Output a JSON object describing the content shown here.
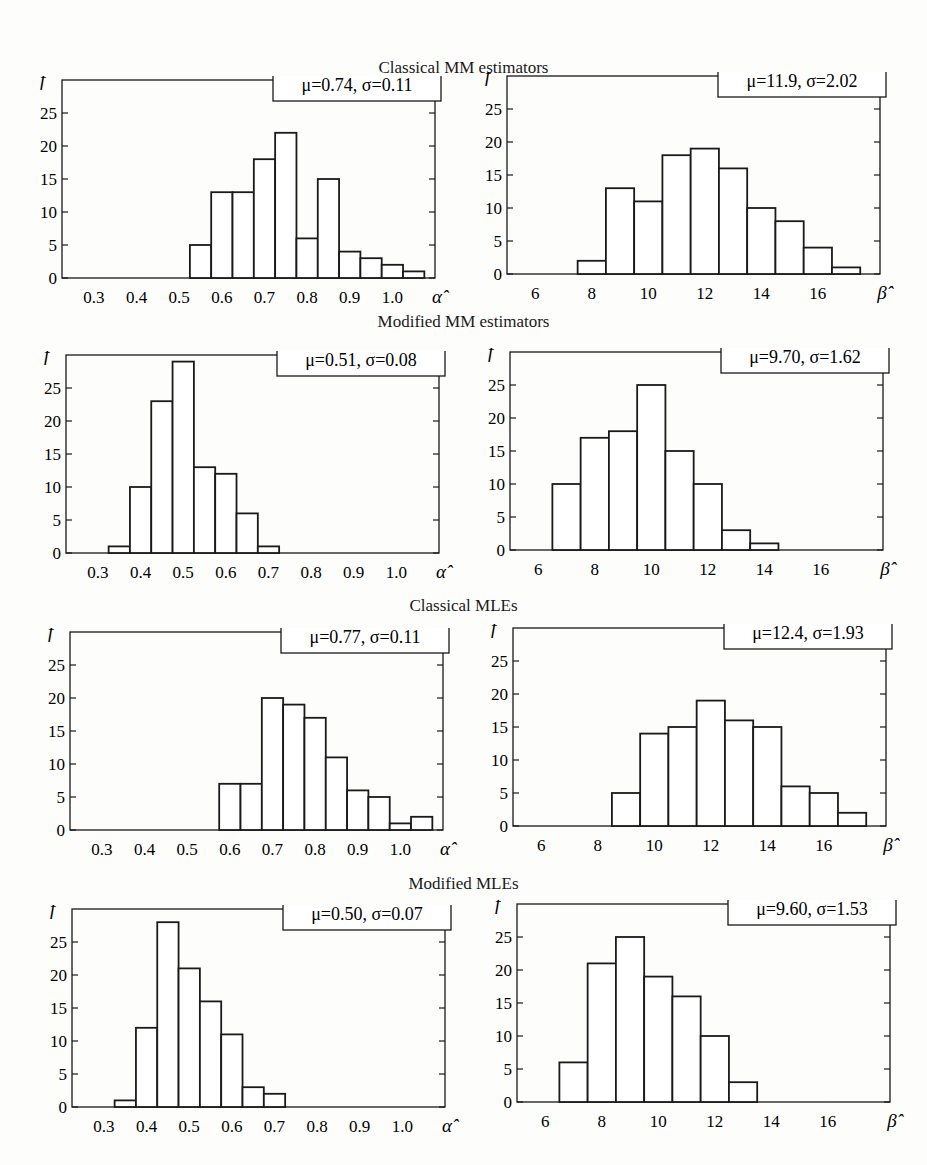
{
  "figure": {
    "sections": [
      {
        "title": "Classical MM estimators"
      },
      {
        "title": "Modified MM estimators"
      },
      {
        "title": "Classical MLEs"
      },
      {
        "title": "Modified MLEs"
      }
    ]
  },
  "chart_data": [
    {
      "type": "bar",
      "group": "Classical MM estimators",
      "panel": "alpha",
      "title": "Classical MM estimators",
      "annotation": "μ=0.74, σ=0.11",
      "xlabel": "α̂",
      "ylabel": "f",
      "xticks": [
        "0.3",
        "0.4",
        "0.5",
        "0.6",
        "0.7",
        "0.8",
        "0.9",
        "1.0"
      ],
      "yticks": [
        "0",
        "5",
        "10",
        "15",
        "20",
        "25"
      ],
      "xlim": [
        0.225,
        1.1
      ],
      "ylim": [
        0,
        30
      ],
      "bin_width": 0.05,
      "bin_starts": [
        0.525,
        0.575,
        0.625,
        0.675,
        0.725,
        0.775,
        0.825,
        0.875,
        0.925,
        0.975,
        1.025
      ],
      "values": [
        5,
        13,
        13,
        18,
        22,
        6,
        15,
        4,
        3,
        2,
        1
      ]
    },
    {
      "type": "bar",
      "group": "Classical MM estimators",
      "panel": "beta",
      "title": "Classical MM estimators",
      "annotation": "μ=11.9, σ=2.02",
      "xlabel": "β̂",
      "ylabel": "f",
      "xticks": [
        "6",
        "8",
        "10",
        "12",
        "14",
        "16"
      ],
      "yticks": [
        "0",
        "5",
        "10",
        "15",
        "20",
        "25"
      ],
      "xlim": [
        5,
        18.2
      ],
      "ylim": [
        0,
        30
      ],
      "bin_width": 1,
      "bin_starts": [
        7.5,
        8.5,
        9.5,
        10.5,
        11.5,
        12.5,
        13.5,
        14.5,
        15.5,
        16.5
      ],
      "values": [
        2,
        13,
        11,
        18,
        19,
        16,
        10,
        8,
        4,
        1
      ]
    },
    {
      "type": "bar",
      "group": "Modified MM estimators",
      "panel": "alpha",
      "title": "Modified MM estimators",
      "annotation": "μ=0.51, σ=0.08",
      "xlabel": "α̂",
      "ylabel": "f",
      "xticks": [
        "0.3",
        "0.4",
        "0.5",
        "0.6",
        "0.7",
        "0.8",
        "0.9",
        "1.0"
      ],
      "yticks": [
        "0",
        "5",
        "10",
        "15",
        "20",
        "25"
      ],
      "xlim": [
        0.225,
        1.1
      ],
      "ylim": [
        0,
        30
      ],
      "bin_width": 0.05,
      "bin_starts": [
        0.325,
        0.375,
        0.425,
        0.475,
        0.525,
        0.575,
        0.625,
        0.675
      ],
      "values": [
        1,
        10,
        23,
        29,
        13,
        12,
        6,
        1
      ]
    },
    {
      "type": "bar",
      "group": "Modified MM estimators",
      "panel": "beta",
      "title": "Modified MM estimators",
      "annotation": "μ=9.70, σ=1.62",
      "xlabel": "β̂",
      "ylabel": "f",
      "xticks": [
        "6",
        "8",
        "10",
        "12",
        "14",
        "16"
      ],
      "yticks": [
        "0",
        "5",
        "10",
        "15",
        "20",
        "25"
      ],
      "xlim": [
        5,
        18.2
      ],
      "ylim": [
        0,
        30
      ],
      "bin_width": 1,
      "bin_starts": [
        6.5,
        7.5,
        8.5,
        9.5,
        10.5,
        11.5,
        12.5,
        13.5
      ],
      "values": [
        10,
        17,
        18,
        25,
        15,
        10,
        3,
        1
      ]
    },
    {
      "type": "bar",
      "group": "Classical MLEs",
      "panel": "alpha",
      "title": "Classical MLEs",
      "annotation": "μ=0.77, σ=0.11",
      "xlabel": "α̂",
      "ylabel": "f",
      "xticks": [
        "0.3",
        "0.4",
        "0.5",
        "0.6",
        "0.7",
        "0.8",
        "0.9",
        "1.0"
      ],
      "yticks": [
        "0",
        "5",
        "10",
        "15",
        "20",
        "25"
      ],
      "xlim": [
        0.225,
        1.1
      ],
      "ylim": [
        0,
        30
      ],
      "bin_width": 0.05,
      "bin_starts": [
        0.575,
        0.625,
        0.675,
        0.725,
        0.775,
        0.825,
        0.875,
        0.925,
        0.975,
        1.025
      ],
      "values": [
        7,
        7,
        20,
        19,
        17,
        11,
        6,
        5,
        1,
        2
      ]
    },
    {
      "type": "bar",
      "group": "Classical MLEs",
      "panel": "beta",
      "title": "Classical MLEs",
      "annotation": "μ=12.4, σ=1.93",
      "xlabel": "β̂",
      "ylabel": "f",
      "xticks": [
        "6",
        "8",
        "10",
        "12",
        "14",
        "16"
      ],
      "yticks": [
        "0",
        "5",
        "10",
        "15",
        "20",
        "25"
      ],
      "xlim": [
        5,
        18.2
      ],
      "ylim": [
        0,
        30
      ],
      "bin_width": 1,
      "bin_starts": [
        8.5,
        9.5,
        10.5,
        11.5,
        12.5,
        13.5,
        14.5,
        15.5,
        16.5
      ],
      "values": [
        5,
        14,
        15,
        19,
        16,
        15,
        6,
        5,
        2
      ]
    },
    {
      "type": "bar",
      "group": "Modified MLEs",
      "panel": "alpha",
      "title": "Modified MLEs",
      "annotation": "μ=0.50, σ=0.07",
      "xlabel": "α̂",
      "ylabel": "f",
      "xticks": [
        "0.3",
        "0.4",
        "0.5",
        "0.6",
        "0.7",
        "0.8",
        "0.9",
        "1.0"
      ],
      "yticks": [
        "0",
        "5",
        "10",
        "15",
        "20",
        "25"
      ],
      "xlim": [
        0.225,
        1.1
      ],
      "ylim": [
        0,
        30
      ],
      "bin_width": 0.05,
      "bin_starts": [
        0.325,
        0.375,
        0.425,
        0.475,
        0.525,
        0.575,
        0.625,
        0.675
      ],
      "values": [
        1,
        12,
        28,
        21,
        16,
        11,
        3,
        2
      ]
    },
    {
      "type": "bar",
      "group": "Modified MLEs",
      "panel": "beta",
      "title": "Modified MLEs",
      "annotation": "μ=9.60, σ=1.53",
      "xlabel": "β̂",
      "ylabel": "f",
      "xticks": [
        "6",
        "8",
        "10",
        "12",
        "14",
        "16"
      ],
      "yticks": [
        "0",
        "5",
        "10",
        "15",
        "20",
        "25"
      ],
      "xlim": [
        5,
        18.2
      ],
      "ylim": [
        0,
        30
      ],
      "bin_width": 1,
      "bin_starts": [
        6.5,
        7.5,
        8.5,
        9.5,
        10.5,
        11.5,
        12.5
      ],
      "values": [
        6,
        21,
        25,
        19,
        16,
        10,
        3
      ]
    }
  ]
}
